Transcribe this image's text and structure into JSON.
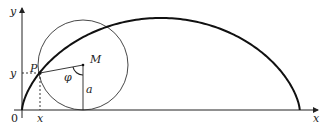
{
  "diagram": {
    "type": "cycloid-construction",
    "labels": {
      "y_axis": "y",
      "x_axis": "x",
      "origin": "0",
      "point": "P",
      "center": "M",
      "angle": "φ",
      "radius": "a",
      "x_coord": "x",
      "y_coord": "y"
    },
    "colors": {
      "stroke": "#222222",
      "background": "#ffffff"
    }
  }
}
